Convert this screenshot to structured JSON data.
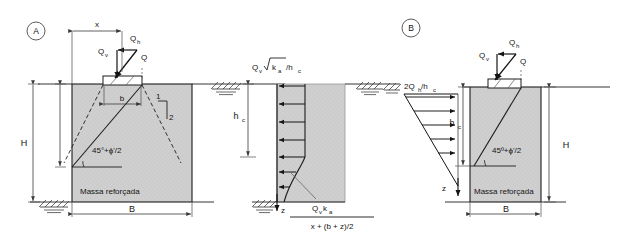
{
  "figure": {
    "panels": [
      {
        "id": "A",
        "tag": "A",
        "name": "panel-a-footing-geometry",
        "labels": {
          "x": "x",
          "b": "b",
          "H": "H",
          "B": "B",
          "Qh": "Q",
          "Qh_sub": "h",
          "Qv": "Q",
          "Qv_sub": "v",
          "Q": "Q",
          "slope_rise": "1",
          "slope_run": "2",
          "angle": "45°+ϕ'/2",
          "mass": "Massa reforçada"
        }
      },
      {
        "id": "M",
        "tag": "",
        "name": "panel-middle-pressure-distribution",
        "labels": {
          "top_formula_main": "Q",
          "top_formula_sub": "v",
          "top_formula_rad": "k",
          "top_formula_rad_sub": "a",
          "top_formula_den": "/h",
          "top_formula_den_sub": "c",
          "hc": "h",
          "hc_sub": "c",
          "z": "z",
          "frac_num_main": "Q",
          "frac_num_sub1": "v",
          "frac_num_k": "k",
          "frac_num_sub2": "a",
          "frac_den": "x + (b + z)/2"
        }
      },
      {
        "id": "B",
        "tag": "B",
        "name": "panel-b-footing-geometry",
        "labels": {
          "top_formula_main": "2Q",
          "top_formula_sub": "h",
          "top_formula_den": "/h",
          "top_formula_den_sub": "c",
          "hc": "h",
          "hc_sub": "c",
          "z": "z",
          "H": "H",
          "B": "B",
          "Qh": "Q",
          "Qh_sub": "h",
          "Qv": "Q",
          "Qv_sub": "v",
          "Q": "Q",
          "angle": "45º+ϕ'/2",
          "mass": "Massa reforçada"
        }
      }
    ],
    "colors": {
      "line": "#141414",
      "soil_fill": "#c9c9c9",
      "soil_fill_light": "#d5d5d5",
      "dim_line": "#444444",
      "background": "#ffffff"
    }
  }
}
